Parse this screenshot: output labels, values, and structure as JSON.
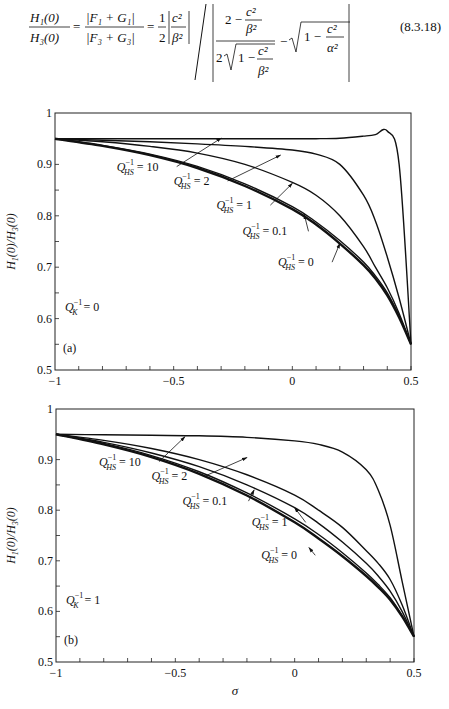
{
  "equation": {
    "lhs_num": "H₁(0)",
    "lhs_den": "H₃(0)",
    "mid_num": "|F₁ + G₁|",
    "mid_den": "|F₃ + G₃|",
    "coef": "1/2",
    "c2_over_b2": "c²/β²",
    "inner_num": "2 − c²/β²",
    "inner_den": "2√(1 − c²/β²)",
    "tail": "√(1 − c²/α²)",
    "number": "(8.3.18)"
  },
  "chart_data": [
    {
      "type": "line",
      "panel_label": "(a)",
      "annotation": "Q_K^{-1} = 0",
      "xlabel": "",
      "ylabel": "H1(0)/H3(0)",
      "xlim": [
        -1,
        0.5
      ],
      "ylim": [
        0.5,
        1
      ],
      "xticks": [
        -1,
        -0.5,
        0,
        0.5
      ],
      "yticks": [
        0.5,
        0.6,
        0.7,
        0.8,
        0.9,
        1
      ],
      "x": [
        -1,
        -0.8,
        -0.6,
        -0.4,
        -0.2,
        0,
        0.1,
        0.2,
        0.3,
        0.35,
        0.4,
        0.45,
        0.5
      ],
      "series": [
        {
          "name": "Q_HS^{-1} = 10",
          "values": [
            0.95,
            0.95,
            0.95,
            0.95,
            0.95,
            0.95,
            0.95,
            0.951,
            0.955,
            0.958,
            0.965,
            0.9,
            0.55
          ],
          "width": 1.4
        },
        {
          "name": "Q_HS^{-1} = 2",
          "values": [
            0.95,
            0.947,
            0.944,
            0.94,
            0.935,
            0.928,
            0.92,
            0.9,
            0.84,
            0.79,
            0.72,
            0.64,
            0.55
          ],
          "width": 1.4
        },
        {
          "name": "Q_HS^{-1} = 1",
          "values": [
            0.95,
            0.944,
            0.935,
            0.922,
            0.9,
            0.865,
            0.84,
            0.8,
            0.74,
            0.7,
            0.66,
            0.61,
            0.55
          ],
          "width": 1.4
        },
        {
          "name": "Q_HS^{-1} = 0.1",
          "values": [
            0.95,
            0.937,
            0.92,
            0.896,
            0.862,
            0.818,
            0.788,
            0.752,
            0.71,
            0.683,
            0.65,
            0.605,
            0.55
          ],
          "width": 1.4
        },
        {
          "name": "Q_HS^{-1} = 0",
          "values": [
            0.95,
            0.936,
            0.918,
            0.893,
            0.858,
            0.813,
            0.783,
            0.746,
            0.704,
            0.678,
            0.645,
            0.602,
            0.55
          ],
          "width": 2.4
        }
      ],
      "labels": [
        {
          "text_main": "Q",
          "sup": "−1",
          "sub": "HS",
          "value": "= 10",
          "x": -0.74,
          "y": 0.888,
          "arrow_to": [
            -0.3,
            0.951
          ]
        },
        {
          "text_main": "Q",
          "sup": "−1",
          "sub": "HS",
          "value": "= 2",
          "x": -0.5,
          "y": 0.86,
          "arrow_to": [
            -0.05,
            0.918
          ]
        },
        {
          "text_main": "Q",
          "sup": "−1",
          "sub": "HS",
          "value": "= 1",
          "x": -0.32,
          "y": 0.813,
          "arrow_to": [
            0.0,
            0.863
          ]
        },
        {
          "text_main": "Q",
          "sup": "−1",
          "sub": "HS",
          "value": "= 0.1",
          "x": -0.21,
          "y": 0.762,
          "arrow_to": [
            0.05,
            0.803
          ]
        },
        {
          "text_main": "Q",
          "sup": "−1",
          "sub": "HS",
          "value": "= 0",
          "x": -0.06,
          "y": 0.702,
          "arrow_to": [
            0.2,
            0.746
          ]
        }
      ],
      "grid": false,
      "legend": "inline annotations"
    },
    {
      "type": "line",
      "panel_label": "(b)",
      "annotation": "Q_K^{-1} = 1",
      "xlabel": "σ",
      "ylabel": "H1(0)/H3(0)",
      "xlim": [
        -1,
        0.5
      ],
      "ylim": [
        0.5,
        1
      ],
      "xticks": [
        -1,
        -0.5,
        0,
        0.5
      ],
      "yticks": [
        0.5,
        0.6,
        0.7,
        0.8,
        0.9,
        1
      ],
      "x": [
        -1,
        -0.8,
        -0.6,
        -0.4,
        -0.2,
        0,
        0.1,
        0.2,
        0.3,
        0.35,
        0.4,
        0.45,
        0.5
      ],
      "series": [
        {
          "name": "Q_HS^{-1} = 10",
          "values": [
            0.95,
            0.949,
            0.948,
            0.947,
            0.944,
            0.937,
            0.93,
            0.915,
            0.88,
            0.84,
            0.77,
            0.66,
            0.55
          ],
          "width": 1.4
        },
        {
          "name": "Q_HS^{-1} = 2",
          "values": [
            0.95,
            0.938,
            0.922,
            0.9,
            0.87,
            0.83,
            0.8,
            0.766,
            0.72,
            0.695,
            0.663,
            0.613,
            0.55
          ],
          "width": 1.4
        },
        {
          "name": "Q_HS^{-1} = 1",
          "values": [
            0.95,
            0.934,
            0.913,
            0.886,
            0.85,
            0.805,
            0.774,
            0.737,
            0.695,
            0.67,
            0.64,
            0.6,
            0.55
          ],
          "width": 1.4
        },
        {
          "name": "Q_HS^{-1} = 0.1",
          "values": [
            0.95,
            0.932,
            0.908,
            0.876,
            0.834,
            0.783,
            0.752,
            0.716,
            0.676,
            0.653,
            0.627,
            0.592,
            0.55
          ],
          "width": 1.4
        },
        {
          "name": "Q_HS^{-1} = 0",
          "values": [
            0.95,
            0.93,
            0.905,
            0.872,
            0.829,
            0.776,
            0.744,
            0.709,
            0.67,
            0.648,
            0.623,
            0.59,
            0.55
          ],
          "width": 2.4
        }
      ],
      "labels": [
        {
          "text_main": "Q",
          "sup": "−1",
          "sub": "HS",
          "value": "= 10",
          "x": -0.82,
          "y": 0.888,
          "arrow_to": [
            -0.46,
            0.945
          ]
        },
        {
          "text_main": "Q",
          "sup": "−1",
          "sub": "HS",
          "value": "= 2",
          "x": -0.6,
          "y": 0.86,
          "arrow_to": [
            -0.2,
            0.904
          ]
        },
        {
          "text_main": "Q",
          "sup": "−1",
          "sub": "HS",
          "value": "= 0.1",
          "x": -0.47,
          "y": 0.81,
          "arrow_to": [
            -0.17,
            0.84
          ]
        },
        {
          "text_main": "Q",
          "sup": "−1",
          "sub": "HS",
          "value": "= 1",
          "x": -0.18,
          "y": 0.768,
          "arrow_to": [
            0.0,
            0.805
          ]
        },
        {
          "text_main": "Q",
          "sup": "−1",
          "sub": "HS",
          "value": "= 0",
          "x": -0.14,
          "y": 0.703,
          "arrow_to": [
            0.06,
            0.726
          ]
        }
      ],
      "grid": false,
      "legend": "inline annotations"
    }
  ]
}
